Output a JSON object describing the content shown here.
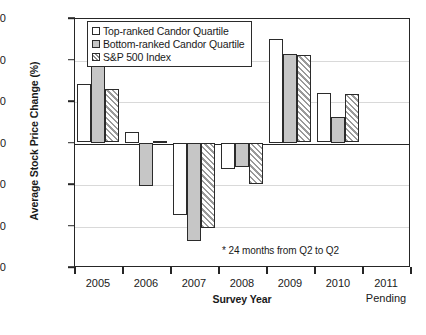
{
  "chart_data": {
    "type": "bar",
    "title": "",
    "xlabel": "Survey Year",
    "ylabel": "Average Stock Price Change (%)",
    "ylim": [
      -60,
      60
    ],
    "ytick_step": 20,
    "yticks": [
      60,
      40,
      20,
      0,
      -20,
      -40,
      -60
    ],
    "ytick_labels": [
      "60",
      "40",
      "20",
      "0",
      "-20",
      "-40",
      "-60"
    ],
    "grid": true,
    "grid_axis": "y",
    "legend_position": "top-left-inside",
    "categories": [
      "2005",
      "2006",
      "2007",
      "2008",
      "2009",
      "2010",
      "2011"
    ],
    "category_sublabels": [
      "",
      "",
      "",
      "",
      "",
      "",
      "Pending"
    ],
    "series": [
      {
        "name": "Top-ranked Candor Quartile",
        "style": "white",
        "values": [
          28,
          5,
          -35,
          -13,
          50,
          24,
          null
        ]
      },
      {
        "name": "Bottom-ranked Candor Quartile",
        "style": "gray",
        "values": [
          37.5,
          -21,
          -47.5,
          -12,
          42.5,
          12.5,
          null
        ]
      },
      {
        "name": "S&P 500 Index",
        "style": "hatched",
        "values": [
          26,
          0.5,
          -41,
          -20,
          42,
          23.5,
          null
        ]
      }
    ],
    "annotations": [
      "* 24 months from Q2 to Q2"
    ],
    "colors": {
      "series_top_fill": "#ffffff",
      "series_bottom_fill": "#c6c6c6",
      "series_sp_hatch": "#9a9a9a",
      "axis": "#262626",
      "gridline": "#d9d9d9",
      "text": "#1a1a1a"
    }
  },
  "legend": {
    "items": [
      {
        "label": "Top-ranked Candor Quartile",
        "style": "series-top"
      },
      {
        "label": "Bottom-ranked Candor Quartile",
        "style": "series-bottom"
      },
      {
        "label": "S&P 500 Index",
        "style": "series-sp"
      }
    ]
  },
  "footnote": "* 24 months from Q2 to Q2"
}
